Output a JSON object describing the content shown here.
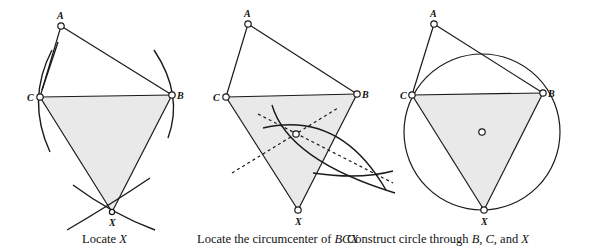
{
  "panels": [
    {
      "id": "locate-x",
      "caption_text": "Locate ",
      "caption_var": "X",
      "points": {
        "A": {
          "label": "A",
          "x": 61,
          "y": 26
        },
        "B": {
          "label": "B",
          "x": 172,
          "y": 95
        },
        "C": {
          "label": "C",
          "x": 40,
          "y": 97
        },
        "X": {
          "label": "X",
          "x": 112,
          "y": 212
        }
      }
    },
    {
      "id": "locate-circumcenter",
      "caption_text": "Locate the circumcenter of ",
      "caption_var": "BCX",
      "points": {
        "A": {
          "label": "A",
          "x": 248,
          "y": 24
        },
        "B": {
          "label": "B",
          "x": 357,
          "y": 94
        },
        "C": {
          "label": "C",
          "x": 226,
          "y": 97
        },
        "X": {
          "label": "X",
          "x": 298,
          "y": 210
        },
        "O": {
          "label": "",
          "x": 296,
          "y": 134
        }
      }
    },
    {
      "id": "construct-circle",
      "caption_parts": [
        "Construct circle through ",
        "B",
        ", ",
        "C",
        ", and ",
        "X"
      ],
      "points": {
        "A": {
          "label": "A",
          "x": 434,
          "y": 24
        },
        "B": {
          "label": "B",
          "x": 543,
          "y": 93
        },
        "C": {
          "label": "C",
          "x": 412,
          "y": 95
        },
        "X": {
          "label": "X",
          "x": 484,
          "y": 210
        },
        "O": {
          "label": "",
          "x": 482,
          "y": 132
        }
      },
      "circle_radius": 78
    }
  ]
}
